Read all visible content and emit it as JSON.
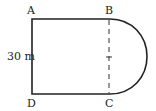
{
  "diagram": {
    "type": "geometry-figure",
    "vertices": {
      "A": "A",
      "B": "B",
      "C": "C",
      "D": "D"
    },
    "side_label": "30 m",
    "colors": {
      "stroke": "#222222",
      "background": "#ffffff"
    }
  }
}
